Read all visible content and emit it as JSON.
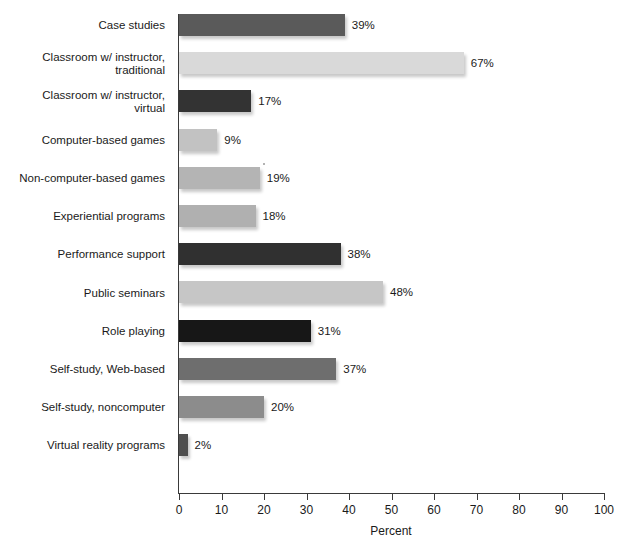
{
  "chart_data": {
    "type": "bar",
    "orientation": "horizontal",
    "title": "",
    "xlabel": "Percent",
    "ylabel": "",
    "xlim": [
      0,
      100
    ],
    "xticks": [
      0,
      10,
      20,
      30,
      40,
      50,
      60,
      70,
      80,
      90,
      100
    ],
    "grid": false,
    "legend": null,
    "value_suffix": "%",
    "categories": [
      "Case studies",
      "Classroom w/ instructor,\ntraditional",
      "Classroom w/ instructor,\nvirtual",
      "Computer-based games",
      "Non-computer-based games",
      "Experiential programs",
      "Performance support",
      "Public seminars",
      "Role playing",
      "Self-study, Web-based",
      "Self-study, noncomputer",
      "Virtual reality programs"
    ],
    "values": [
      39,
      67,
      17,
      9,
      19,
      18,
      38,
      48,
      31,
      37,
      20,
      2
    ],
    "value_labels": [
      "39%",
      "67%",
      "17%",
      "9%",
      "19%",
      "18%",
      "38%",
      "48%",
      "31%",
      "37%",
      "20%",
      "2%"
    ],
    "bar_colors": [
      "#5a5a5a",
      "#d9d9d9",
      "#333333",
      "#c2c2c2",
      "#b4b4b4",
      "#b0b0b0",
      "#303030",
      "#c6c6c6",
      "#171717",
      "#6e6e6e",
      "#8c8c8c",
      "#4f4f4f"
    ]
  },
  "axis": {
    "x_tick_labels": [
      "0",
      "10",
      "20",
      "30",
      "40",
      "50",
      "60",
      "70",
      "80",
      "90",
      "100"
    ],
    "x_axis_title": "Percent"
  },
  "colors": {
    "axis": "#3a3a3a",
    "text": "#1a1a1a",
    "background": "#ffffff"
  }
}
